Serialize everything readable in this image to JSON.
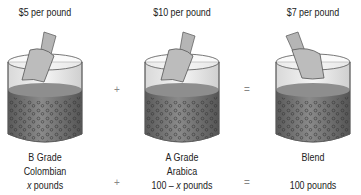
{
  "jars": [
    {
      "price": "$5 per pound",
      "line1": "B Grade",
      "line2": "Colombian",
      "line3_var": "x",
      "line3_text": " pounds"
    },
    {
      "price": "$10 per pound",
      "line1": "A Grade",
      "line2": "Arabica",
      "line3_prefix": "100 – ",
      "line3_var": "x",
      "line3_text": " pounds"
    },
    {
      "price": "$7 per pound",
      "line1": "Blend",
      "line2": "",
      "line3_text": "100 pounds"
    }
  ],
  "operators": {
    "top_plus": "+",
    "top_equals": "=",
    "bottom_plus": "+",
    "bottom_equals": "="
  },
  "colors": {
    "liquid": "#6e6e6e",
    "liquid_top": "#9a9a9a",
    "glass": "#e8e8e8",
    "outline": "#555555",
    "scoop": "#a8a8a8"
  }
}
